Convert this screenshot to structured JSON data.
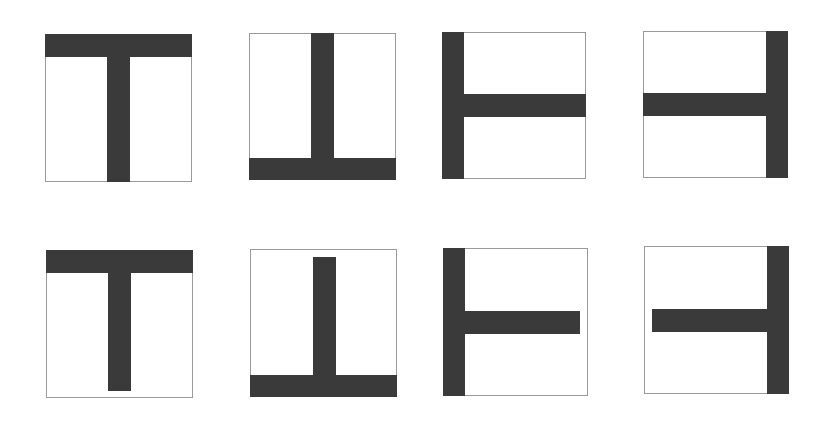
{
  "colors": {
    "frame": "#9a9a9a",
    "bar": "#3a3a3a",
    "background": "#ffffff"
  },
  "rows": [
    {
      "variant": "touching",
      "description": "Stem reaches the opposite edge of the frame",
      "items": [
        {
          "orientation": "up",
          "label": "T"
        },
        {
          "orientation": "down",
          "label": "inverted T"
        },
        {
          "orientation": "left",
          "label": "rotated T facing right"
        },
        {
          "orientation": "right",
          "label": "rotated T facing left"
        }
      ]
    },
    {
      "variant": "gap",
      "description": "Stem stops short of the opposite edge of the frame",
      "items": [
        {
          "orientation": "up",
          "label": "T"
        },
        {
          "orientation": "down",
          "label": "inverted T"
        },
        {
          "orientation": "left",
          "label": "rotated T facing right"
        },
        {
          "orientation": "right",
          "label": "rotated T facing left"
        }
      ]
    }
  ]
}
